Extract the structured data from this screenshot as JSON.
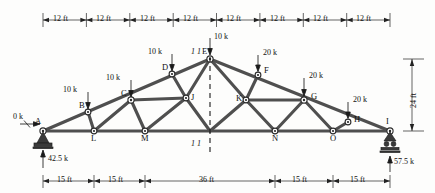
{
  "figure": {
    "type": "truss-diagram",
    "span_ft": 96,
    "height_ft": 24
  },
  "top_dimensions": {
    "labels": [
      "12 ft",
      "12 ft",
      "12 ft",
      "12 ft",
      "12 ft",
      "12 ft",
      "12 ft",
      "12 ft"
    ]
  },
  "bottom_dimensions": {
    "labels": [
      "15 ft",
      "15 ft",
      "36 ft",
      "15 ft",
      "15 ft"
    ]
  },
  "height_dimension": {
    "label": "24 ft"
  },
  "nodes": [
    {
      "id": "A",
      "label": "A"
    },
    {
      "id": "B",
      "label": "B"
    },
    {
      "id": "C",
      "label": "C"
    },
    {
      "id": "D",
      "label": "D"
    },
    {
      "id": "E",
      "label": "E"
    },
    {
      "id": "F",
      "label": "F"
    },
    {
      "id": "G",
      "label": "G"
    },
    {
      "id": "H",
      "label": "H"
    },
    {
      "id": "I",
      "label": "I"
    },
    {
      "id": "J",
      "label": "J"
    },
    {
      "id": "K",
      "label": "K"
    },
    {
      "id": "L",
      "label": "L"
    },
    {
      "id": "M",
      "label": "M"
    },
    {
      "id": "N",
      "label": "N"
    },
    {
      "id": "O",
      "label": "O"
    }
  ],
  "loads": [
    {
      "at": "A",
      "label": "0 k",
      "direction": "horizontal"
    },
    {
      "at": "B",
      "label": "10 k",
      "direction": "down"
    },
    {
      "at": "C",
      "label": "10 k",
      "direction": "down"
    },
    {
      "at": "D",
      "label": "10 k",
      "direction": "down"
    },
    {
      "at": "E",
      "label": "10 k",
      "direction": "down"
    },
    {
      "at": "F",
      "label": "20 k",
      "direction": "down"
    },
    {
      "at": "G",
      "label": "20 k",
      "direction": "down"
    },
    {
      "at": "H",
      "label": "20 k",
      "direction": "down"
    }
  ],
  "reactions": [
    {
      "at": "A",
      "label": "42.5 k",
      "support": "pin"
    },
    {
      "at": "I",
      "label": "57.5 k",
      "support": "roller"
    }
  ],
  "section": {
    "top_label": "1 1",
    "bottom_label": "1 1"
  },
  "colors": {
    "member": "#4b4b4b",
    "ink": "#111111",
    "paper": "#fdfdfc"
  }
}
